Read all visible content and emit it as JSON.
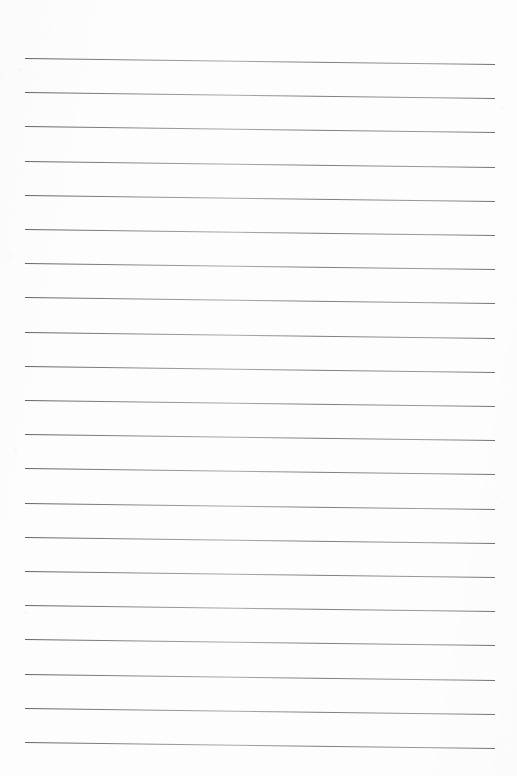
{
  "document": {
    "type": "lined-paper-scan",
    "title": "Blank Lined Notebook Page",
    "description": "Scanned blank sheet of ruled writing paper with horizontal ruled lines and no written content",
    "page_width_px": 517,
    "page_height_px": 776,
    "background_color": "#fdfdfd",
    "written_text": ""
  },
  "ruling": {
    "line_color": "#6b6b6b",
    "line_thickness_px": 1,
    "line_count": 21,
    "left_margin_px": 25,
    "right_margin_px": 495,
    "line_length_px": 470,
    "first_line_y_px": 58,
    "last_line_y_px": 742,
    "line_spacing_px": 34.2,
    "skew_degrees": 0.72,
    "has_vertical_margin_rule": false,
    "has_header_rule": false,
    "lines": [
      {
        "index": 1,
        "y_px": 58.0,
        "content": ""
      },
      {
        "index": 2,
        "y_px": 92.2,
        "content": ""
      },
      {
        "index": 3,
        "y_px": 126.4,
        "content": ""
      },
      {
        "index": 4,
        "y_px": 160.6,
        "content": ""
      },
      {
        "index": 5,
        "y_px": 194.8,
        "content": ""
      },
      {
        "index": 6,
        "y_px": 229.0,
        "content": ""
      },
      {
        "index": 7,
        "y_px": 263.2,
        "content": ""
      },
      {
        "index": 8,
        "y_px": 297.4,
        "content": ""
      },
      {
        "index": 9,
        "y_px": 331.6,
        "content": ""
      },
      {
        "index": 10,
        "y_px": 365.8,
        "content": ""
      },
      {
        "index": 11,
        "y_px": 400.0,
        "content": ""
      },
      {
        "index": 12,
        "y_px": 434.2,
        "content": ""
      },
      {
        "index": 13,
        "y_px": 468.4,
        "content": ""
      },
      {
        "index": 14,
        "y_px": 502.6,
        "content": ""
      },
      {
        "index": 15,
        "y_px": 536.8,
        "content": ""
      },
      {
        "index": 16,
        "y_px": 571.0,
        "content": ""
      },
      {
        "index": 17,
        "y_px": 605.2,
        "content": ""
      },
      {
        "index": 18,
        "y_px": 639.4,
        "content": ""
      },
      {
        "index": 19,
        "y_px": 673.6,
        "content": ""
      },
      {
        "index": 20,
        "y_px": 707.8,
        "content": ""
      },
      {
        "index": 21,
        "y_px": 742.0,
        "content": ""
      }
    ]
  }
}
